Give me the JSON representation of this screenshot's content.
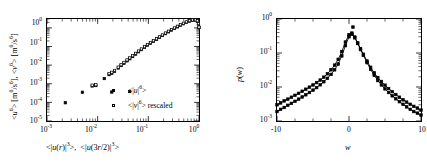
{
  "figure": {
    "panels": [
      "left-moments-scaling",
      "right-pdf"
    ]
  },
  "left": {
    "xlabel": "<|u(r)|3>,  <|u(3r/2)|3>",
    "ylabel": "<u6> [m6/s6],  <v6> [m6/s6]",
    "xticks": [
      "10-3",
      "10-2",
      "10-1",
      "100"
    ],
    "yticks": [
      "100",
      "10-1",
      "10-2",
      "10-3",
      "10-4",
      "10-5"
    ],
    "legend": [
      {
        "label": "<|u|6>",
        "marker": "filled-square"
      },
      {
        "label": "<|v|6> rescaled",
        "marker": "open-square"
      }
    ]
  },
  "right": {
    "xlabel": "w",
    "ylabel": "p(w)",
    "xticks": [
      "-10",
      "0",
      "10"
    ],
    "yticks": [
      "100",
      "10-1",
      "10-2",
      "10-3"
    ]
  },
  "chart_data": [
    {
      "type": "scatter",
      "id": "left-moments-scaling",
      "title": "",
      "xlabel": "<|u(r)|^3>, <|u(3r/2)|^3>",
      "ylabel": "<u^6> [m^6/s^6], <v^6> [m^6/s^6]",
      "xscale": "log",
      "yscale": "log",
      "xlim": [
        0.001,
        1.0
      ],
      "ylim": [
        1e-05,
        3.0
      ],
      "grid": false,
      "legend_position": "lower-right-inside",
      "series": [
        {
          "name": "<|u|^6>",
          "marker": "filled-square",
          "x": [
            0.0023,
            0.005,
            0.0078,
            0.0092,
            0.0135,
            0.0168,
            0.019,
            0.0215,
            0.0255,
            0.029,
            0.033,
            0.038,
            0.043,
            0.049,
            0.056,
            0.064,
            0.073,
            0.084,
            0.096,
            0.11,
            0.126,
            0.145,
            0.166,
            0.19,
            0.218,
            0.25,
            0.286,
            0.328,
            0.376,
            0.43,
            0.493,
            0.565,
            0.648,
            0.742,
            0.85,
            0.93,
            0.975,
            1.0
          ],
          "y": [
            9.5e-05,
            0.00035,
            0.00076,
            0.0008,
            0.0019,
            0.0031,
            0.0036,
            0.0046,
            0.007,
            0.0095,
            0.0125,
            0.017,
            0.022,
            0.029,
            0.039,
            0.052,
            0.068,
            0.09,
            0.118,
            0.15,
            0.19,
            0.24,
            0.31,
            0.39,
            0.49,
            0.61,
            0.76,
            0.93,
            1.13,
            1.38,
            1.66,
            1.98,
            2.3,
            2.55,
            2.65,
            2.3,
            1.6,
            1.05
          ]
        },
        {
          "name": "<|v|^6> rescaled",
          "marker": "open-square",
          "x": [
            0.0078,
            0.0092,
            0.0168,
            0.019,
            0.0215,
            0.0255,
            0.029,
            0.033,
            0.038,
            0.043,
            0.049,
            0.056,
            0.064,
            0.073,
            0.084,
            0.096,
            0.11,
            0.126,
            0.145,
            0.166,
            0.19,
            0.218,
            0.25,
            0.286,
            0.328,
            0.376,
            0.43,
            0.493,
            0.565,
            0.648,
            0.742,
            0.85,
            0.93,
            0.975,
            1.0
          ],
          "y": [
            0.00084,
            0.00088,
            0.0035,
            0.0041,
            0.0052,
            0.0078,
            0.0105,
            0.014,
            0.019,
            0.0245,
            0.032,
            0.043,
            0.057,
            0.074,
            0.098,
            0.128,
            0.162,
            0.205,
            0.26,
            0.33,
            0.42,
            0.53,
            0.66,
            0.82,
            1.0,
            1.22,
            1.48,
            1.78,
            2.1,
            2.42,
            2.66,
            2.72,
            2.4,
            1.7,
            1.1
          ]
        },
        {
          "name": "extra-low-branch",
          "marker": "filled-square",
          "x": [
            0.019,
            0.043
          ],
          "y": [
            0.00036,
            0.00038
          ]
        }
      ]
    },
    {
      "type": "line",
      "id": "right-pdf",
      "title": "",
      "xlabel": "w",
      "ylabel": "p(w)",
      "xscale": "linear",
      "yscale": "log",
      "xlim": [
        -10,
        10
      ],
      "ylim": [
        0.001,
        1.0
      ],
      "grid": false,
      "legend_position": "none",
      "series": [
        {
          "name": "pdf-upper",
          "marker": "filled-square",
          "x": [
            -10,
            -9.5,
            -9,
            -8.5,
            -8,
            -7.5,
            -7,
            -6.5,
            -6,
            -5.5,
            -5,
            -4.5,
            -4,
            -3.5,
            -3,
            -2.5,
            -2,
            -1.5,
            -1,
            -0.5,
            0,
            0.4,
            0.8,
            1.2,
            1.6,
            2,
            2.5,
            3,
            3.5,
            4,
            4.5,
            5,
            5.5,
            6,
            6.5,
            7,
            7.5,
            8,
            8.5,
            9,
            9.5,
            10
          ],
          "y": [
            0.003,
            0.0034,
            0.0039,
            0.0044,
            0.005,
            0.0057,
            0.0065,
            0.0075,
            0.0086,
            0.0099,
            0.0115,
            0.0135,
            0.016,
            0.0195,
            0.0245,
            0.032,
            0.044,
            0.065,
            0.11,
            0.21,
            0.345,
            0.385,
            0.295,
            0.2,
            0.135,
            0.092,
            0.058,
            0.038,
            0.026,
            0.019,
            0.0145,
            0.0113,
            0.009,
            0.0073,
            0.006,
            0.005,
            0.0042,
            0.0036,
            0.0031,
            0.0027,
            0.0024,
            0.0021
          ]
        },
        {
          "name": "pdf-lower",
          "marker": "filled-square",
          "x": [
            -10,
            -9.5,
            -9,
            -8.5,
            -8,
            -7.5,
            -7,
            -6.5,
            -6,
            -5.5,
            -5,
            -4.5,
            -4,
            -3.5,
            -3,
            -2.5,
            -2,
            -1.5,
            -1,
            -0.5,
            0,
            0.4,
            0.8,
            1.2,
            1.6,
            2,
            2.5,
            3,
            3.5,
            4,
            4.5,
            5,
            5.5,
            6,
            6.5,
            7,
            7.5,
            8,
            8.5,
            9,
            9.5,
            10
          ],
          "y": [
            0.0019,
            0.0022,
            0.0025,
            0.0029,
            0.0033,
            0.0038,
            0.0044,
            0.0051,
            0.0059,
            0.0069,
            0.0081,
            0.0096,
            0.0116,
            0.0143,
            0.018,
            0.0235,
            0.032,
            0.0475,
            0.082,
            0.165,
            0.3,
            0.355,
            0.28,
            0.19,
            0.126,
            0.085,
            0.052,
            0.033,
            0.022,
            0.0155,
            0.0115,
            0.0088,
            0.0069,
            0.0055,
            0.0045,
            0.0037,
            0.0031,
            0.0026,
            0.0022,
            0.0019,
            0.0017,
            0.0015
          ]
        },
        {
          "name": "peak-outlier",
          "marker": "filled-square",
          "x": [
            0.55
          ],
          "y": [
            0.58
          ]
        }
      ]
    }
  ]
}
